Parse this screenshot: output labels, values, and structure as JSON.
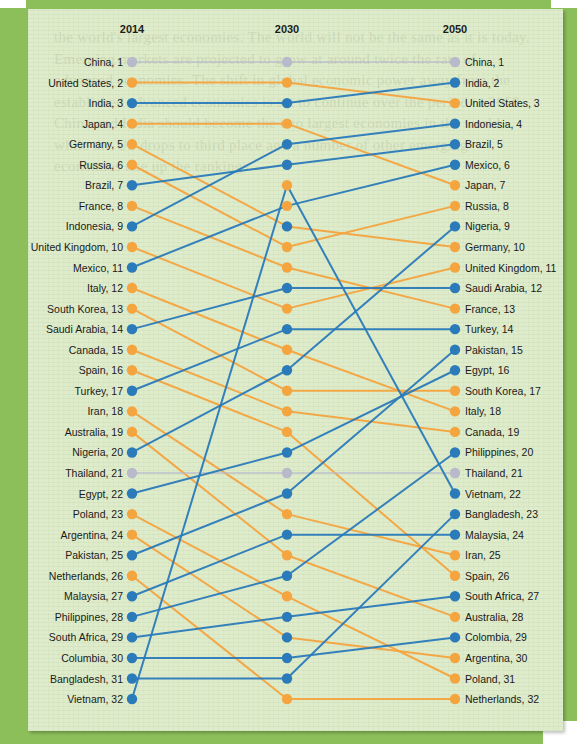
{
  "chart_data": {
    "type": "line",
    "chart_kind": "bump-chart",
    "title": "",
    "columns": [
      "2014",
      "2030",
      "2050"
    ],
    "xlabel": "",
    "ylabel": "Rank",
    "ylim": [
      1,
      32
    ],
    "grid": false,
    "legend": "none",
    "colors": {
      "rank_up": "#2b7bba",
      "rank_down": "#f5a540",
      "rank_same": "#b9b9cc",
      "panel_background": "#dfeccb",
      "frame": "#8cbf5a"
    },
    "series": [
      {
        "name": "China",
        "color": "rank_same",
        "ranks": [
          1,
          1,
          1
        ]
      },
      {
        "name": "United States",
        "color": "rank_down",
        "ranks": [
          2,
          2,
          3
        ]
      },
      {
        "name": "India",
        "color": "rank_up",
        "ranks": [
          3,
          3,
          2
        ]
      },
      {
        "name": "Japan",
        "color": "rank_down",
        "ranks": [
          4,
          4,
          7
        ]
      },
      {
        "name": "Germany",
        "color": "rank_down",
        "ranks": [
          5,
          9,
          10
        ]
      },
      {
        "name": "Russia",
        "color": "rank_down",
        "ranks": [
          6,
          10,
          8
        ]
      },
      {
        "name": "Brazil",
        "color": "rank_up",
        "ranks": [
          7,
          6,
          5
        ]
      },
      {
        "name": "France",
        "color": "rank_down",
        "ranks": [
          8,
          11,
          13
        ]
      },
      {
        "name": "Indonesia",
        "color": "rank_up",
        "ranks": [
          9,
          5,
          4
        ]
      },
      {
        "name": "United Kingdom",
        "color": "rank_down",
        "ranks": [
          10,
          13,
          11
        ]
      },
      {
        "name": "Mexico",
        "color": "rank_up",
        "ranks": [
          11,
          8,
          6
        ]
      },
      {
        "name": "Italy",
        "color": "rank_down",
        "ranks": [
          12,
          15,
          18
        ]
      },
      {
        "name": "South Korea",
        "color": "rank_down",
        "ranks": [
          13,
          17,
          17
        ]
      },
      {
        "name": "Saudi Arabia",
        "color": "rank_up",
        "ranks": [
          14,
          12,
          12
        ]
      },
      {
        "name": "Canada",
        "color": "rank_down",
        "ranks": [
          15,
          18,
          19
        ]
      },
      {
        "name": "Spain",
        "color": "rank_down",
        "ranks": [
          16,
          19,
          26
        ]
      },
      {
        "name": "Turkey",
        "color": "rank_up",
        "ranks": [
          17,
          14,
          14
        ]
      },
      {
        "name": "Iran",
        "color": "rank_down",
        "ranks": [
          18,
          23,
          25
        ]
      },
      {
        "name": "Australia",
        "color": "rank_down",
        "ranks": [
          19,
          25,
          28
        ]
      },
      {
        "name": "Nigeria",
        "color": "rank_up",
        "ranks": [
          20,
          16,
          9
        ]
      },
      {
        "name": "Thailand",
        "color": "rank_same",
        "ranks": [
          21,
          21,
          21
        ]
      },
      {
        "name": "Egypt",
        "color": "rank_up",
        "ranks": [
          22,
          20,
          16
        ]
      },
      {
        "name": "Poland",
        "color": "rank_down",
        "ranks": [
          23,
          27,
          31
        ]
      },
      {
        "name": "Argentina",
        "color": "rank_down",
        "ranks": [
          24,
          29,
          30
        ]
      },
      {
        "name": "Pakistan",
        "color": "rank_up",
        "ranks": [
          25,
          22,
          15
        ]
      },
      {
        "name": "Netherlands",
        "color": "rank_down",
        "ranks": [
          26,
          32,
          32
        ]
      },
      {
        "name": "Malaysia",
        "color": "rank_up",
        "ranks": [
          27,
          24,
          24
        ]
      },
      {
        "name": "Philippines",
        "color": "rank_up",
        "ranks": [
          28,
          26,
          20
        ]
      },
      {
        "name": "South Africa",
        "color": "rank_up",
        "ranks": [
          29,
          28,
          27
        ]
      },
      {
        "name": "Columbia",
        "color": "rank_up",
        "ranks": [
          30,
          30,
          29
        ]
      },
      {
        "name": "Bangladesh",
        "color": "rank_up",
        "ranks": [
          31,
          31,
          23
        ]
      },
      {
        "name": "Vietnam",
        "color": "rank_up",
        "ranks": [
          32,
          7,
          22
        ]
      }
    ],
    "left_labels": [
      "China,  1",
      "United States,  2",
      "India,  3",
      "Japan,  4",
      "Germany,  5",
      "Russia,  6",
      "Brazil,  7",
      "France,  8",
      "Indonesia,  9",
      "United Kingdom,  10",
      "Mexico,  11",
      "Italy,  12",
      "South Korea,  13",
      "Saudi Arabia,  14",
      "Canada,  15",
      "Spain,  16",
      "Turkey,  17",
      "Iran,  18",
      "Australia,  19",
      "Nigeria,  20",
      "Thailand,  21",
      "Egypt,  22",
      "Poland,  23",
      "Argentina,  24",
      "Pakistan,  25",
      "Netherlands,  26",
      "Malaysia,  27",
      "Philippines,  28",
      "South Africa,  29",
      "Columbia,  30",
      "Bangladesh,  31",
      "Vietnam,  32"
    ],
    "right_labels": [
      "China,  1",
      "India,  2",
      "United States,  3",
      "Indonesia,  4",
      "Brazil,  5",
      "Mexico,  6",
      "Japan,  7",
      "Russia,  8",
      "Nigeria,  9",
      "Germany,  10",
      "United Kingdom,  11",
      "Saudi Arabia,  12",
      "France,  13",
      "Turkey,  14",
      "Pakistan,  15",
      "Egypt,  16",
      "South Korea,  17",
      "Italy,  18",
      "Canada,  19",
      "Philippines,  20",
      "Thailand,  21",
      "Vietnam,  22",
      "Bangladesh,  23",
      "Malaysia,  24",
      "Iran,  25",
      "Spain,  26",
      "South Africa,  27",
      "Australia,  28",
      "Colombia,  29",
      "Argentina,  30",
      "Poland,  31",
      "Netherlands,  32"
    ],
    "dot_colors_2014": [
      "rank_same",
      "rank_down",
      "rank_up",
      "rank_down",
      "rank_down",
      "rank_down",
      "rank_up",
      "rank_down",
      "rank_up",
      "rank_down",
      "rank_up",
      "rank_down",
      "rank_down",
      "rank_up",
      "rank_down",
      "rank_down",
      "rank_up",
      "rank_down",
      "rank_down",
      "rank_up",
      "rank_same",
      "rank_up",
      "rank_down",
      "rank_down",
      "rank_up",
      "rank_down",
      "rank_up",
      "rank_up",
      "rank_up",
      "rank_up",
      "rank_up",
      "rank_up"
    ],
    "dot_colors_2030": [
      "rank_same",
      "rank_down",
      "rank_up",
      "rank_down",
      "rank_up",
      "rank_up",
      "rank_down",
      "rank_down",
      "rank_up",
      "rank_down",
      "rank_down",
      "rank_up",
      "rank_down",
      "rank_up",
      "rank_down",
      "rank_up",
      "rank_down",
      "rank_down",
      "rank_down",
      "rank_up",
      "rank_same",
      "rank_up",
      "rank_down",
      "rank_up",
      "rank_down",
      "rank_up",
      "rank_down",
      "rank_up",
      "rank_up",
      "rank_up",
      "rank_up",
      "rank_down"
    ],
    "dot_colors_2050": [
      "rank_same",
      "rank_up",
      "rank_down",
      "rank_up",
      "rank_up",
      "rank_up",
      "rank_down",
      "rank_down",
      "rank_up",
      "rank_down",
      "rank_down",
      "rank_up",
      "rank_down",
      "rank_up",
      "rank_up",
      "rank_up",
      "rank_down",
      "rank_down",
      "rank_down",
      "rank_up",
      "rank_same",
      "rank_up",
      "rank_up",
      "rank_up",
      "rank_down",
      "rank_down",
      "rank_up",
      "rank_down",
      "rank_up",
      "rank_down",
      "rank_down",
      "rank_down"
    ]
  },
  "ghost_text": "the world's largest economies. The world will not be the same as it is today. Emerging markets are projected to grow at around twice the rate of advanced economies. The shift in global economic power away from the established advanced economies is set to continue over the period to 2050. China and India should become the two largest economies in the world, while the US drops to third place and a number of other emerging economies rise up the rankings."
}
